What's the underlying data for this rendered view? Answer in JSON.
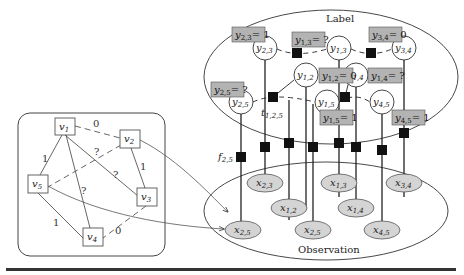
{
  "left_graph": {
    "nodes": [
      {
        "id": "v1",
        "label": "v",
        "sub": "1"
      },
      {
        "id": "v2",
        "label": "v",
        "sub": "2"
      },
      {
        "id": "v3",
        "label": "v",
        "sub": "3"
      },
      {
        "id": "v4",
        "label": "v",
        "sub": "4"
      },
      {
        "id": "v5",
        "label": "v",
        "sub": "5"
      }
    ],
    "edges": [
      {
        "from": "v1",
        "to": "v2",
        "label": "0",
        "style": "dashed"
      },
      {
        "from": "v1",
        "to": "v5",
        "label": "1",
        "style": "solid"
      },
      {
        "from": "v1",
        "to": "v3",
        "label": "?",
        "style": "solid"
      },
      {
        "from": "v1",
        "to": "v4",
        "label": "?",
        "style": "solid"
      },
      {
        "from": "v2",
        "to": "v5",
        "label": "?",
        "style": "dashed"
      },
      {
        "from": "v2",
        "to": "v3",
        "label": "1",
        "style": "solid"
      },
      {
        "from": "v5",
        "to": "v4",
        "label": "1",
        "style": "solid"
      },
      {
        "from": "v3",
        "to": "v4",
        "label": "0",
        "style": "dashed"
      }
    ]
  },
  "label_region": {
    "title": "Label",
    "y_nodes": [
      {
        "id": "y23",
        "text": "y",
        "sub": "2,3"
      },
      {
        "id": "y13",
        "text": "y",
        "sub": "1,3"
      },
      {
        "id": "y34",
        "text": "y",
        "sub": "3,4"
      },
      {
        "id": "y12",
        "text": "y",
        "sub": "1,2"
      },
      {
        "id": "y14",
        "text": "y",
        "sub": "1,4"
      },
      {
        "id": "y25",
        "text": "y",
        "sub": "2,5"
      },
      {
        "id": "y15",
        "text": "y",
        "sub": "1,5"
      },
      {
        "id": "y45",
        "text": "y",
        "sub": "4,5"
      }
    ],
    "assignments": [
      {
        "var": "y",
        "sub": "2,3",
        "value": "= 1"
      },
      {
        "var": "y",
        "sub": "1,3",
        "value": "= ?"
      },
      {
        "var": "y",
        "sub": "3,4",
        "value": "= 0"
      },
      {
        "var": "y",
        "sub": "1,2",
        "value": "= 0"
      },
      {
        "var": "y",
        "sub": "1,4",
        "value": "= ?"
      },
      {
        "var": "y",
        "sub": "2,5",
        "value": "= ?"
      },
      {
        "var": "y",
        "sub": "1,5",
        "value": "= 1"
      },
      {
        "var": "y",
        "sub": "4,5",
        "value": "= 1"
      }
    ],
    "triad_factor_label": {
      "var": "t",
      "sub": "1,2,5"
    }
  },
  "observation_region": {
    "title": "Observation",
    "x_nodes": [
      {
        "id": "x23",
        "text": "x",
        "sub": "2,3"
      },
      {
        "id": "x13",
        "text": "x",
        "sub": "1,3"
      },
      {
        "id": "x34",
        "text": "x",
        "sub": "3,4"
      },
      {
        "id": "x12",
        "text": "x",
        "sub": "1,2"
      },
      {
        "id": "x14",
        "text": "x",
        "sub": "1,4"
      },
      {
        "id": "x25a",
        "text": "x",
        "sub": "2,5"
      },
      {
        "id": "x25b",
        "text": "x",
        "sub": "2,5"
      },
      {
        "id": "x45",
        "text": "x",
        "sub": "4,5"
      }
    ],
    "factor_label": {
      "var": "f",
      "sub": "2,5"
    }
  },
  "colors": {
    "box_fill": "#b3b3b3",
    "ellipse_fill": "#d4d4d4",
    "factor_fill": "#111111",
    "line": "#222222"
  }
}
